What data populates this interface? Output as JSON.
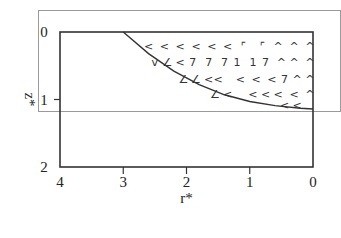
{
  "figure": {
    "y_axis": {
      "label": "z*",
      "ticks": [
        "0",
        "1",
        "2"
      ],
      "range": [
        0,
        2
      ],
      "direction": "down"
    },
    "x_axis": {
      "label": "r*",
      "ticks": [
        "4",
        "3",
        "2",
        "1",
        "0"
      ],
      "range": [
        4,
        0
      ],
      "direction": "reversed"
    },
    "curve": {
      "description": "boundary curve from (r*=3, z*=0) to (r*=0, z*~1.15)",
      "points": [
        [
          3.0,
          0.0
        ],
        [
          2.6,
          0.32
        ],
        [
          2.2,
          0.58
        ],
        [
          1.8,
          0.78
        ],
        [
          1.4,
          0.93
        ],
        [
          1.0,
          1.03
        ],
        [
          0.6,
          1.09
        ],
        [
          0.2,
          1.13
        ],
        [
          0.0,
          1.14
        ]
      ]
    },
    "vector_rows": [
      {
        "z": 0.2,
        "glyphs": [
          "<",
          "<",
          "<",
          "<",
          "<",
          "<",
          "⌜",
          "⌜",
          "^",
          "^",
          "^"
        ],
        "r": [
          2.6,
          2.35,
          2.1,
          1.85,
          1.6,
          1.35,
          1.1,
          0.8,
          0.55,
          0.3,
          0.05
        ]
      },
      {
        "z": 0.45,
        "glyphs": [
          "v",
          "∠",
          "<",
          "7",
          "7",
          "7",
          "1",
          "1",
          "7",
          "^",
          "^",
          "^"
        ],
        "r": [
          2.5,
          2.3,
          2.1,
          1.9,
          1.65,
          1.4,
          1.2,
          0.95,
          0.75,
          0.5,
          0.3,
          0.05
        ]
      },
      {
        "z": 0.7,
        "glyphs": [
          "∠",
          "∠",
          "<",
          "<",
          "<",
          "<",
          "<",
          "7",
          "^",
          "^"
        ],
        "r": [
          2.05,
          1.85,
          1.65,
          1.5,
          1.15,
          0.9,
          0.65,
          0.45,
          0.25,
          0.05
        ]
      },
      {
        "z": 0.92,
        "glyphs": [
          "∠",
          "<",
          "<",
          "<",
          "<",
          "<",
          "^"
        ],
        "r": [
          1.55,
          1.35,
          0.95,
          0.75,
          0.55,
          0.3,
          0.05
        ]
      },
      {
        "z": 1.08,
        "glyphs": [
          "<",
          "<"
        ],
        "r": [
          0.45,
          0.25
        ]
      }
    ]
  }
}
